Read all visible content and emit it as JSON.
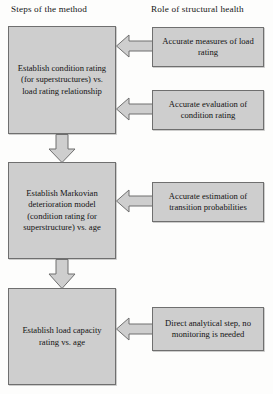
{
  "diagram": {
    "columns": {
      "left_header": "Steps of the method",
      "right_header": "Role of structural health"
    },
    "colors": {
      "node_fill": "#cecece",
      "node_border": "#6f6f6f",
      "arrow_fill": "#cecece",
      "arrow_border": "#6f6f6f",
      "text": "#131313",
      "background": "#fdfdfc"
    },
    "steps": [
      {
        "id": "condition-rating",
        "label": "Establish condition rating (for superstructures) vs. load rating relationship"
      },
      {
        "id": "markovian-model",
        "label": "Establish Markovian deterioration model (condition rating for superstructure) vs. age"
      },
      {
        "id": "load-capacity",
        "label": "Establish load capacity rating vs. age"
      }
    ],
    "roles": [
      {
        "id": "accurate-measures",
        "label": "Accurate measures of load rating"
      },
      {
        "id": "accurate-evaluation",
        "label": "Accurate evaluation of condition rating"
      },
      {
        "id": "accurate-estimation",
        "label": "Accurate estimation of transition probabilities"
      },
      {
        "id": "direct-analytical",
        "label": "Direct analytical step, no monitoring is needed"
      }
    ],
    "connectors": [
      {
        "id": "measures-to-condition",
        "from": "accurate-measures",
        "to": "condition-rating",
        "direction": "left"
      },
      {
        "id": "evaluation-to-condition",
        "from": "accurate-evaluation",
        "to": "condition-rating",
        "direction": "left"
      },
      {
        "id": "condition-to-markovian",
        "from": "condition-rating",
        "to": "markovian-model",
        "direction": "down"
      },
      {
        "id": "estimation-to-markovian",
        "from": "accurate-estimation",
        "to": "markovian-model",
        "direction": "left"
      },
      {
        "id": "markovian-to-loadcapacity",
        "from": "markovian-model",
        "to": "load-capacity",
        "direction": "down"
      },
      {
        "id": "direct-to-loadcapacity",
        "from": "direct-analytical",
        "to": "load-capacity",
        "direction": "left"
      }
    ]
  }
}
